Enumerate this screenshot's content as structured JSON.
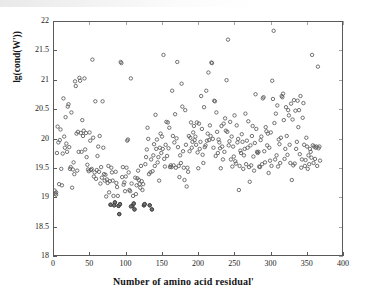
{
  "chart_data": {
    "type": "scatter",
    "title": "",
    "xlabel": "Number of amino acid residual'",
    "ylabel": "lg(cond(W'))",
    "xlim": [
      0,
      400
    ],
    "ylim": [
      18,
      22
    ],
    "xticks": [
      0,
      50,
      100,
      150,
      200,
      250,
      300,
      350,
      400
    ],
    "xticklabels": [
      "0",
      "50",
      "100",
      "150",
      "200",
      "250",
      "300",
      "350",
      "400"
    ],
    "yticks": [
      18,
      18.5,
      19,
      19.5,
      20,
      20.5,
      21,
      21.5,
      22
    ],
    "yticklabels": [
      "18",
      "18.5",
      "19",
      "19.5",
      "20",
      "20.5",
      "21",
      "21.5",
      "22"
    ],
    "grid": false,
    "legend": null,
    "marker": "open-circle",
    "marker_color": "#5a5a5a",
    "marker_size": 3.4,
    "box": true,
    "n_points": 348,
    "points": [
      [
        1,
        19.13
      ],
      [
        2,
        19.08
      ],
      [
        3,
        19.1
      ],
      [
        3,
        19.06
      ],
      [
        4,
        19.77
      ],
      [
        5,
        20.22
      ],
      [
        6,
        19.95
      ],
      [
        7,
        19.24
      ],
      [
        8,
        19.99
      ],
      [
        9,
        20.17
      ],
      [
        10,
        19.5
      ],
      [
        11,
        19.22
      ],
      [
        12,
        19.76
      ],
      [
        13,
        20.7
      ],
      [
        14,
        20.05
      ],
      [
        15,
        19.86
      ],
      [
        16,
        20.38
      ],
      [
        17,
        19.93
      ],
      [
        18,
        19.79
      ],
      [
        19,
        20.56
      ],
      [
        20,
        20.6
      ],
      [
        21,
        19.87
      ],
      [
        22,
        19.5
      ],
      [
        23,
        19.53
      ],
      [
        24,
        20.46
      ],
      [
        25,
        19.18
      ],
      [
        26,
        19.49
      ],
      [
        27,
        19.61
      ],
      [
        28,
        19.41
      ],
      [
        29,
        20.99
      ],
      [
        30,
        20.91
      ],
      [
        31,
        20.1
      ],
      [
        32,
        19.47
      ],
      [
        33,
        20.13
      ],
      [
        34,
        19.79
      ],
      [
        35,
        21.05
      ],
      [
        36,
        21.0
      ],
      [
        37,
        20.11
      ],
      [
        38,
        19.79
      ],
      [
        39,
        20.33
      ],
      [
        40,
        20.06
      ],
      [
        41,
        20.15
      ],
      [
        42,
        21.04
      ],
      [
        43,
        19.83
      ],
      [
        44,
        20.11
      ],
      [
        45,
        19.7
      ],
      [
        46,
        19.57
      ],
      [
        47,
        19.49
      ],
      [
        48,
        19.46
      ],
      [
        49,
        20.12
      ],
      [
        50,
        19.98
      ],
      [
        51,
        19.48
      ],
      [
        52,
        19.5
      ],
      [
        53,
        21.36
      ],
      [
        54,
        20.03
      ],
      [
        55,
        19.37
      ],
      [
        56,
        19.44
      ],
      [
        57,
        20.65
      ],
      [
        58,
        19.33
      ],
      [
        59,
        19.48
      ],
      [
        60,
        19.72
      ],
      [
        61,
        19.88
      ],
      [
        62,
        19.45
      ],
      [
        63,
        20.06
      ],
      [
        64,
        19.25
      ],
      [
        65,
        19.53
      ],
      [
        66,
        19.35
      ],
      [
        67,
        20.65
      ],
      [
        68,
        19.86
      ],
      [
        69,
        19.41
      ],
      [
        70,
        19.3
      ],
      [
        71,
        19.4
      ],
      [
        72,
        19.03
      ],
      [
        73,
        19.32
      ],
      [
        74,
        19.26
      ],
      [
        75,
        19.55
      ],
      [
        76,
        19.1
      ],
      [
        77,
        19.29
      ],
      [
        78,
        18.89
      ],
      [
        79,
        19.52
      ],
      [
        80,
        19.44
      ],
      [
        81,
        19.3
      ],
      [
        82,
        19.04
      ],
      [
        83,
        18.88
      ],
      [
        84,
        18.93
      ],
      [
        85,
        19.45
      ],
      [
        86,
        19.26
      ],
      [
        87,
        19.19
      ],
      [
        88,
        19.04
      ],
      [
        89,
        18.87
      ],
      [
        90,
        18.73
      ],
      [
        91,
        18.9
      ],
      [
        92,
        21.32
      ],
      [
        93,
        21.3
      ],
      [
        94,
        19.36
      ],
      [
        95,
        19.53
      ],
      [
        96,
        19.23
      ],
      [
        97,
        19.27
      ],
      [
        98,
        19.12
      ],
      [
        99,
        19.37
      ],
      [
        100,
        19.52
      ],
      [
        101,
        19.98
      ],
      [
        102,
        20.0
      ],
      [
        103,
        19.44
      ],
      [
        104,
        19.14
      ],
      [
        105,
        19.12
      ],
      [
        106,
        21.04
      ],
      [
        107,
        19.25
      ],
      [
        108,
        18.87
      ],
      [
        109,
        19.04
      ],
      [
        110,
        18.91
      ],
      [
        111,
        18.81
      ],
      [
        112,
        19.35
      ],
      [
        113,
        19.07
      ],
      [
        114,
        19.22
      ],
      [
        115,
        19.34
      ],
      [
        116,
        19.47
      ],
      [
        117,
        19.31
      ],
      [
        118,
        19.24
      ],
      [
        119,
        19.18
      ],
      [
        120,
        19.55
      ],
      [
        121,
        19.29
      ],
      [
        122,
        19.14
      ],
      [
        123,
        19.24
      ],
      [
        124,
        18.88
      ],
      [
        125,
        18.9
      ],
      [
        126,
        19.58
      ],
      [
        127,
        19.7
      ],
      [
        128,
        19.83
      ],
      [
        129,
        20.2
      ],
      [
        130,
        20.01
      ],
      [
        131,
        19.41
      ],
      [
        132,
        18.88
      ],
      [
        133,
        19.44
      ],
      [
        134,
        19.66
      ],
      [
        135,
        18.81
      ],
      [
        136,
        19.46
      ],
      [
        137,
        19.73
      ],
      [
        138,
        19.92
      ],
      [
        139,
        19.55
      ],
      [
        140,
        20.42
      ],
      [
        141,
        19.84
      ],
      [
        142,
        20.0
      ],
      [
        143,
        19.61
      ],
      [
        144,
        19.7
      ],
      [
        145,
        19.3
      ],
      [
        146,
        19.86
      ],
      [
        147,
        20.1
      ],
      [
        148,
        19.77
      ],
      [
        149,
        20.05
      ],
      [
        150,
        19.84
      ],
      [
        151,
        21.44
      ],
      [
        152,
        19.67
      ],
      [
        153,
        19.54
      ],
      [
        154,
        19.91
      ],
      [
        155,
        20.3
      ],
      [
        156,
        19.72
      ],
      [
        157,
        20.29
      ],
      [
        158,
        19.85
      ],
      [
        159,
        20.2
      ],
      [
        160,
        19.53
      ],
      [
        161,
        19.56
      ],
      [
        162,
        19.53
      ],
      [
        163,
        20.83
      ],
      [
        164,
        20.06
      ],
      [
        165,
        19.56
      ],
      [
        166,
        19.95
      ],
      [
        167,
        20.43
      ],
      [
        168,
        19.52
      ],
      [
        169,
        20.02
      ],
      [
        170,
        21.32
      ],
      [
        171,
        19.87
      ],
      [
        172,
        19.55
      ],
      [
        173,
        19.36
      ],
      [
        174,
        19.73
      ],
      [
        175,
        19.6
      ],
      [
        176,
        20.95
      ],
      [
        177,
        20.56
      ],
      [
        178,
        19.8
      ],
      [
        179,
        19.52
      ],
      [
        180,
        19.31
      ],
      [
        181,
        20.5
      ],
      [
        182,
        19.91
      ],
      [
        183,
        19.2
      ],
      [
        184,
        19.52
      ],
      [
        185,
        19.45
      ],
      [
        186,
        20.06
      ],
      [
        187,
        19.8
      ],
      [
        188,
        20.03
      ],
      [
        189,
        20.29
      ],
      [
        190,
        19.86
      ],
      [
        191,
        19.96
      ],
      [
        192,
        20.12
      ],
      [
        193,
        20.23
      ],
      [
        194,
        19.99
      ],
      [
        195,
        20.05
      ],
      [
        196,
        19.91
      ],
      [
        197,
        20.29
      ],
      [
        198,
        19.78
      ],
      [
        199,
        19.51
      ],
      [
        200,
        20.27
      ],
      [
        201,
        19.84
      ],
      [
        202,
        19.96
      ],
      [
        203,
        20.74
      ],
      [
        204,
        20.18
      ],
      [
        205,
        19.74
      ],
      [
        206,
        19.6
      ],
      [
        207,
        20.55
      ],
      [
        208,
        19.87
      ],
      [
        209,
        19.9
      ],
      [
        210,
        20.83
      ],
      [
        211,
        19.98
      ],
      [
        212,
        20.1
      ],
      [
        213,
        21.14
      ],
      [
        214,
        19.99
      ],
      [
        215,
        20.24
      ],
      [
        216,
        20.06
      ],
      [
        217,
        21.31
      ],
      [
        218,
        21.3
      ],
      [
        219,
        20.01
      ],
      [
        220,
        19.86
      ],
      [
        221,
        20.66
      ],
      [
        222,
        20.65
      ],
      [
        223,
        19.72
      ],
      [
        224,
        20.46
      ],
      [
        225,
        20.13
      ],
      [
        226,
        19.77
      ],
      [
        227,
        20.0
      ],
      [
        228,
        19.95
      ],
      [
        229,
        19.85
      ],
      [
        230,
        19.51
      ],
      [
        231,
        20.23
      ],
      [
        232,
        19.88
      ],
      [
        233,
        19.66
      ],
      [
        234,
        20.27
      ],
      [
        235,
        19.79
      ],
      [
        236,
        20.36
      ],
      [
        237,
        20.15
      ],
      [
        238,
        21.01
      ],
      [
        239,
        20.13
      ],
      [
        240,
        21.7
      ],
      [
        241,
        19.9
      ],
      [
        242,
        19.97
      ],
      [
        243,
        20.3
      ],
      [
        244,
        19.66
      ],
      [
        245,
        20.05
      ],
      [
        246,
        19.54
      ],
      [
        247,
        19.88
      ],
      [
        248,
        19.71
      ],
      [
        249,
        20.41
      ],
      [
        250,
        19.63
      ],
      [
        251,
        19.59
      ],
      [
        252,
        20.24
      ],
      [
        253,
        19.95
      ],
      [
        254,
        20.01
      ],
      [
        255,
        19.14
      ],
      [
        256,
        19.55
      ],
      [
        257,
        19.81
      ],
      [
        258,
        19.77
      ],
      [
        259,
        20.09
      ],
      [
        260,
        19.96
      ],
      [
        261,
        19.5
      ],
      [
        262,
        19.73
      ],
      [
        263,
        19.84
      ],
      [
        264,
        20.44
      ],
      [
        265,
        19.58
      ],
      [
        266,
        19.98
      ],
      [
        267,
        19.86
      ],
      [
        268,
        20.31
      ],
      [
        269,
        19.53
      ],
      [
        270,
        19.28
      ],
      [
        271,
        19.9
      ],
      [
        272,
        19.56
      ],
      [
        273,
        20.06
      ],
      [
        274,
        20.23
      ],
      [
        275,
        19.71
      ],
      [
        276,
        19.47
      ],
      [
        277,
        19.94
      ],
      [
        278,
        20.77
      ],
      [
        279,
        20.18
      ],
      [
        280,
        19.79
      ],
      [
        281,
        19.77
      ],
      [
        282,
        19.79
      ],
      [
        283,
        19.54
      ],
      [
        284,
        19.53
      ],
      [
        285,
        19.99
      ],
      [
        286,
        20.05
      ],
      [
        287,
        19.58
      ],
      [
        288,
        20.7
      ],
      [
        289,
        20.72
      ],
      [
        290,
        19.8
      ],
      [
        291,
        19.61
      ],
      [
        292,
        20.21
      ],
      [
        293,
        20.14
      ],
      [
        294,
        19.9
      ],
      [
        295,
        20.1
      ],
      [
        296,
        19.43
      ],
      [
        297,
        19.86
      ],
      [
        298,
        19.64
      ],
      [
        299,
        20.12
      ],
      [
        300,
        19.55
      ],
      [
        301,
        21.0
      ],
      [
        302,
        20.69
      ],
      [
        303,
        21.85
      ],
      [
        304,
        20.28
      ],
      [
        305,
        19.66
      ],
      [
        306,
        20.44
      ],
      [
        307,
        19.73
      ],
      [
        308,
        20.58
      ],
      [
        309,
        19.54
      ],
      [
        310,
        20.0
      ],
      [
        311,
        19.92
      ],
      [
        312,
        19.6
      ],
      [
        313,
        20.03
      ],
      [
        314,
        20.74
      ],
      [
        315,
        20.72
      ],
      [
        316,
        20.78
      ],
      [
        317,
        20.33
      ],
      [
        318,
        19.67
      ],
      [
        319,
        19.84
      ],
      [
        320,
        20.55
      ],
      [
        321,
        20.06
      ],
      [
        322,
        19.74
      ],
      [
        323,
        20.5
      ],
      [
        324,
        20.41
      ],
      [
        325,
        19.91
      ],
      [
        326,
        19.6
      ],
      [
        327,
        20.61
      ],
      [
        328,
        19.31
      ],
      [
        329,
        20.34
      ],
      [
        330,
        19.56
      ],
      [
        331,
        20.67
      ],
      [
        332,
        19.59
      ],
      [
        333,
        20.49
      ],
      [
        334,
        19.84
      ],
      [
        335,
        19.96
      ],
      [
        336,
        20.66
      ],
      [
        337,
        20.21
      ],
      [
        338,
        20.5
      ],
      [
        339,
        19.75
      ],
      [
        340,
        20.74
      ],
      [
        341,
        19.52
      ],
      [
        342,
        19.66
      ],
      [
        343,
        20.37
      ],
      [
        344,
        20.62
      ],
      [
        345,
        19.91
      ],
      [
        346,
        19.55
      ],
      [
        347,
        19.65
      ],
      [
        348,
        20.03
      ],
      [
        349,
        19.88
      ],
      [
        350,
        19.5
      ],
      [
        351,
        19.73
      ],
      [
        352,
        19.58
      ],
      [
        353,
        19.84
      ],
      [
        354,
        19.79
      ],
      [
        355,
        19.69
      ],
      [
        356,
        21.44
      ],
      [
        357,
        19.9
      ],
      [
        358,
        19.6
      ],
      [
        359,
        19.88
      ],
      [
        360,
        19.67
      ],
      [
        361,
        19.86
      ],
      [
        362,
        19.88
      ],
      [
        363,
        19.55
      ],
      [
        364,
        21.24
      ],
      [
        365,
        19.85
      ],
      [
        366,
        19.88
      ],
      [
        367,
        19.64
      ]
    ],
    "dark_points": [
      [
        78,
        18.89
      ],
      [
        83,
        18.88
      ],
      [
        84,
        18.93
      ],
      [
        89,
        18.87
      ],
      [
        90,
        18.73
      ],
      [
        91,
        18.9
      ],
      [
        108,
        18.87
      ],
      [
        110,
        18.91
      ],
      [
        111,
        18.81
      ],
      [
        124,
        18.88
      ],
      [
        125,
        18.9
      ],
      [
        132,
        18.88
      ],
      [
        135,
        18.81
      ],
      [
        106,
        18.86
      ]
    ]
  }
}
